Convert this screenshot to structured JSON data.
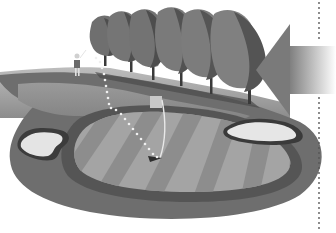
{
  "illustration": {
    "subject": "golf-hole-wind-diagram",
    "style": "grayscale",
    "elements": {
      "trees_count": 6,
      "bunkers_count": 2,
      "has_golfer": true,
      "has_wind_arrow": true,
      "has_dotted_ball_path": true,
      "has_green_with_flag": true,
      "has_vertical_dotted_line": true
    },
    "colors": {
      "background": "#ffffff",
      "rough": "#6e6e6e",
      "fairway": "#8f8f8f",
      "green_light": "#a9a9a9",
      "green_dark": "#8a8a8a",
      "fringe": "#5a5a5a",
      "bunker": "#e4e4e4",
      "tree_dark": "#4e4e4e",
      "tree_mid": "#777777",
      "arrow": "#7a7a7a",
      "path_dots": "#f2f2f2"
    }
  }
}
